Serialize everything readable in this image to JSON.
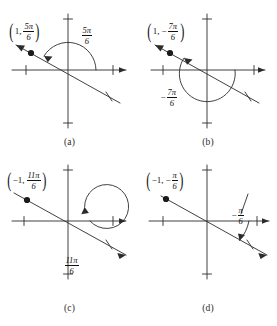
{
  "figure": {
    "name": "polar-coordinate-angle-diagrams",
    "background_color": "#ffffff",
    "stroke_color": "#2b2b2b",
    "panel_count": 4
  },
  "panels": [
    {
      "id": "a",
      "caption": "(a)",
      "point_label": {
        "open_paren": "(",
        "r": "1",
        "comma": ",",
        "sign": "",
        "num": "5π",
        "den": "6",
        "close_paren": ")"
      },
      "angle_label": {
        "sign": "",
        "num": "5π",
        "den": "6"
      },
      "angle_value_pi_sixths": 5,
      "r_value": 1,
      "arc_direction": "counterclockwise",
      "arc_position": "above-axis"
    },
    {
      "id": "b",
      "caption": "(b)",
      "point_label": {
        "open_paren": "(",
        "r": "1",
        "comma": ",",
        "sign": "−",
        "num": "7π",
        "den": "6",
        "close_paren": ")"
      },
      "angle_label": {
        "sign": "−",
        "num": "7π",
        "den": "6"
      },
      "angle_value_pi_sixths": -7,
      "r_value": 1,
      "arc_direction": "clockwise",
      "arc_position": "below-axis"
    },
    {
      "id": "c",
      "caption": "(c)",
      "point_label": {
        "open_paren": "(",
        "r": "−1",
        "comma": ",",
        "sign": "",
        "num": "11π",
        "den": "6",
        "close_paren": ")"
      },
      "angle_label": {
        "sign": "",
        "num": "11π",
        "den": "6"
      },
      "angle_value_pi_sixths": 11,
      "r_value": -1,
      "arc_direction": "counterclockwise",
      "arc_position": "full-loop"
    },
    {
      "id": "d",
      "caption": "(d)",
      "point_label": {
        "open_paren": "(",
        "r": "−1",
        "comma": ",",
        "sign": "−",
        "num": "π",
        "den": "6",
        "close_paren": ")"
      },
      "angle_label": {
        "sign": "−",
        "num": "π",
        "den": "6"
      },
      "angle_value_pi_sixths": -1,
      "r_value": -1,
      "arc_direction": "clockwise",
      "arc_position": "small-below-axis"
    }
  ]
}
